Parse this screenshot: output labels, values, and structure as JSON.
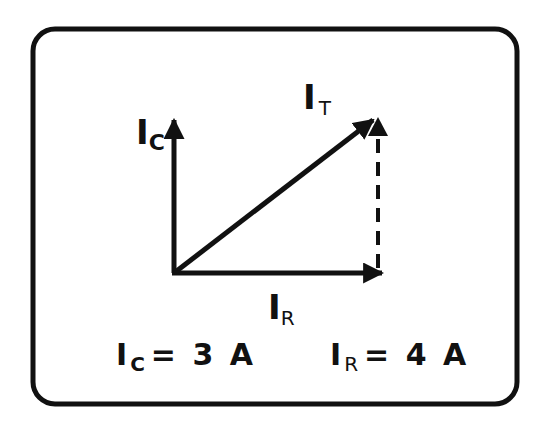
{
  "diagram": {
    "title": "",
    "type": "phasor-diagram",
    "colors": {
      "stroke": "#111111",
      "background": "#ffffff"
    },
    "vectors": [
      {
        "id": "ic",
        "symbol": "I",
        "subscript": "C",
        "direction": "up",
        "style": "solid"
      },
      {
        "id": "ir",
        "symbol": "I",
        "subscript": "R",
        "direction": "right",
        "style": "solid"
      },
      {
        "id": "it",
        "symbol": "I",
        "subscript": "T",
        "direction": "diagonal",
        "style": "solid"
      },
      {
        "id": "ic-projection",
        "direction": "up",
        "style": "dashed"
      }
    ],
    "labels": {
      "ic": {
        "main": "I",
        "sub": "C"
      },
      "it": {
        "main": "I",
        "sub": "T"
      },
      "ir": {
        "main": "I",
        "sub": "R"
      }
    },
    "equations": {
      "ic": {
        "main": "I",
        "sub": "C",
        "rest": "= 3 A"
      },
      "ir": {
        "main": "I",
        "sub": "R",
        "rest": "= 4 A"
      }
    }
  }
}
